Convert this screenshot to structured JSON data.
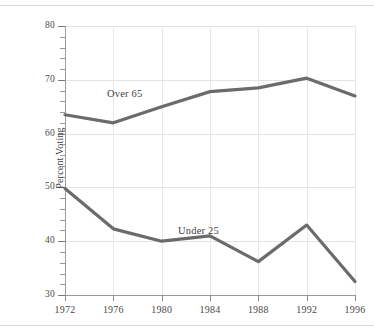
{
  "figure": {
    "background_color": "#ffffff",
    "line_color": "#6b6b6b",
    "grid_color": "#e3e3e3",
    "axis_color": "#9a9a9a",
    "text_color": "#4a4a4a"
  },
  "axis": {
    "ylabel": "Percent Voting",
    "xlabel": "",
    "yticks": [
      "80",
      "70",
      "60",
      "50",
      "40",
      "30"
    ],
    "xticks": [
      "1972",
      "1976",
      "1980",
      "1984",
      "1988",
      "1992",
      "1996"
    ]
  },
  "annotations": {
    "over65": "Over 65",
    "under25": "Under 25"
  },
  "chart_data": {
    "type": "line",
    "title": "",
    "xlabel": "",
    "ylabel": "Percent Voting",
    "x": [
      1972,
      1976,
      1980,
      1984,
      1988,
      1992,
      1996
    ],
    "categories": [
      "1972",
      "1976",
      "1980",
      "1984",
      "1988",
      "1992",
      "1996"
    ],
    "series": [
      {
        "name": "Over 65",
        "values": [
          63.5,
          62.0,
          65.0,
          67.8,
          68.5,
          70.3,
          67.0
        ],
        "label_text": "Over 65",
        "color": "#6b6b6b"
      },
      {
        "name": "Under 25",
        "values": [
          49.8,
          42.3,
          40.0,
          41.0,
          36.2,
          43.0,
          32.5
        ],
        "label_text": "Under 25",
        "color": "#6b6b6b"
      }
    ],
    "xlim": [
      1972,
      1996
    ],
    "ylim": [
      30,
      80
    ],
    "ytick_values": [
      80,
      70,
      60,
      50,
      40,
      30
    ],
    "ytick_minor_step": 2,
    "grid": true,
    "legend": "inline-labels"
  }
}
